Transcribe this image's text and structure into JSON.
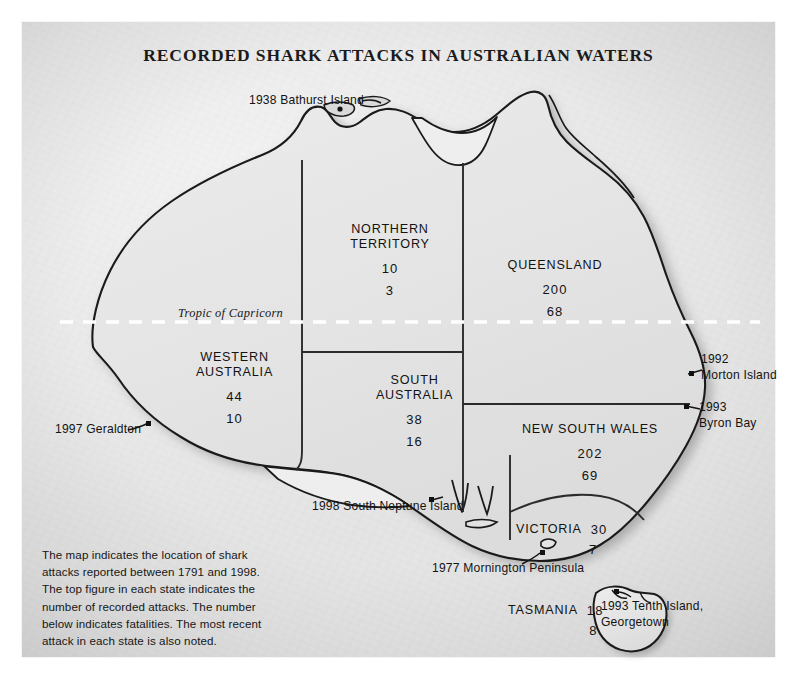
{
  "title": "RECORDED SHARK ATTACKS IN AUSTRALIAN WATERS",
  "caption": "The map indicates the location of shark attacks reported between 1791 and 1998. The top figure in each state indicates the number of recorded attacks. The number below indicates fatalities. The most recent attack in each state is also noted.",
  "tropic_label": "Tropic of Capricorn",
  "colors": {
    "land": "#e3e3e3",
    "outline": "#1a1a1a",
    "border": "#2b2b2b",
    "paper": "#eeeeee",
    "text": "#131313",
    "shadow": "#9a9a9a"
  },
  "states": [
    {
      "id": "northern-territory",
      "name_lines": [
        "NORTHERN",
        "TERRITORY"
      ],
      "attacks": "10",
      "fatalities": "3"
    },
    {
      "id": "queensland",
      "name_lines": [
        "QUEENSLAND"
      ],
      "attacks": "200",
      "fatalities": "68"
    },
    {
      "id": "western-australia",
      "name_lines": [
        "WESTERN",
        "AUSTRALIA"
      ],
      "attacks": "44",
      "fatalities": "10"
    },
    {
      "id": "south-australia",
      "name_lines": [
        "SOUTH",
        "AUSTRALIA"
      ],
      "attacks": "38",
      "fatalities": "16"
    },
    {
      "id": "new-south-wales",
      "name_lines": [
        "NEW SOUTH WALES"
      ],
      "attacks": "202",
      "fatalities": "69"
    },
    {
      "id": "victoria",
      "name_lines": [
        "VICTORIA"
      ],
      "attacks": "30",
      "fatalities": "7"
    },
    {
      "id": "tasmania",
      "name_lines": [
        "TASMANIA"
      ],
      "attacks": "18",
      "fatalities": "8"
    }
  ],
  "state_text": {
    "nt_l1": "NORTHERN",
    "nt_l2": "TERRITORY",
    "nt_a": "10",
    "nt_f": "3",
    "qld_l1": "QUEENSLAND",
    "qld_a": "200",
    "qld_f": "68",
    "wa_l1": "WESTERN",
    "wa_l2": "AUSTRALIA",
    "wa_a": "44",
    "wa_f": "10",
    "sa_l1": "SOUTH",
    "sa_l2": "AUSTRALIA",
    "sa_a": "38",
    "sa_f": "16",
    "nsw_l1": "NEW SOUTH WALES",
    "nsw_a": "202",
    "nsw_f": "69",
    "vic_l1": "VICTORIA",
    "vic_a": "30",
    "vic_f": "7",
    "tas_l1": "TASMANIA",
    "tas_a": "18",
    "tas_f": "8"
  },
  "annotations": {
    "bathurst": "1938 Bathurst Island",
    "morton_l1": "1992",
    "morton_l2": "Morton Island",
    "byron_l1": "1993",
    "byron_l2": "Byron Bay",
    "geraldton": "1997 Geraldton",
    "neptune": "1998 South Neptune Island",
    "mornington": "1977 Mornington Peninsula",
    "tenth_l1": "1993 Tenth Island,",
    "tenth_l2": "Georgetown"
  },
  "map_meta": {
    "period_start": "1791",
    "period_end": "1998",
    "total_attacks": "542",
    "total_fatalities": "181"
  }
}
